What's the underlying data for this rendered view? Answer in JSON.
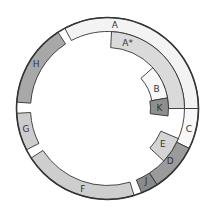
{
  "diagram": {
    "center": [
      107.5,
      108.5
    ],
    "outer_circle_radius": 91,
    "colors": {
      "white": "#f6f6f6",
      "pale": "#f0f0f0",
      "light": "#d6d6d6",
      "mid_light": "#cccccc",
      "mid": "#a9a9a9",
      "dark": "#999999",
      "darker": "#8a8a8a",
      "outline": "#333333"
    },
    "segments": [
      {
        "id": "A",
        "label": "A",
        "r0": 77,
        "r1": 91,
        "a0": 332,
        "a1": 450,
        "fill": "#f3f3f3",
        "label_r": 84,
        "label_a": 5
      },
      {
        "id": "A*",
        "label": "A*",
        "r0": 61,
        "r1": 77,
        "a0": 3,
        "a1": 90,
        "fill": "#dadada",
        "label_r": 69,
        "label_a": 17
      },
      {
        "id": "B",
        "label": "B",
        "r0": 45,
        "r1": 61,
        "a0": 48,
        "a1": 80,
        "fill": "#f7f7f7",
        "label_r": 53,
        "label_a": 68
      },
      {
        "id": "K",
        "label": "K",
        "r0": 43,
        "r1": 61,
        "a0": 80,
        "a1": 97,
        "fill": "#8e8e8e",
        "label_r": 52,
        "label_a": 89
      },
      {
        "id": "C",
        "label": "C",
        "r0": 77,
        "r1": 91,
        "a0": 90,
        "a1": 116,
        "fill": "#f8f8f8",
        "label_r": 84,
        "label_a": 104
      },
      {
        "id": "D",
        "label": "D",
        "r0": 77,
        "r1": 91,
        "a0": 116,
        "a1": 147,
        "fill": "#9b9b9b",
        "label_r": 82,
        "label_a": 130
      },
      {
        "id": "E",
        "label": "E",
        "r0": 58,
        "r1": 77,
        "a0": 113,
        "a1": 133,
        "fill": "#d4d4d4",
        "label_r": 66,
        "label_a": 123
      },
      {
        "id": "J",
        "label": "J",
        "r0": 77,
        "r1": 91,
        "a0": 147,
        "a1": 158,
        "fill": "#8a8a8a",
        "label_r": 82,
        "label_a": 152
      },
      {
        "id": "F",
        "label": "F",
        "r0": 77,
        "r1": 91,
        "a0": 163,
        "a1": 237,
        "fill": "#cecece",
        "label_r": 84,
        "label_a": 197
      },
      {
        "id": "G",
        "label": "G",
        "r0": 77,
        "r1": 91,
        "a0": 243,
        "a1": 267,
        "fill": "#cdcdcd",
        "label_r": 84,
        "label_a": 256
      },
      {
        "id": "H",
        "label": "H",
        "r0": 77,
        "r1": 91,
        "a0": 274,
        "a1": 327,
        "fill": "#a8a8a8",
        "label_r": 84,
        "label_a": 302
      }
    ]
  }
}
